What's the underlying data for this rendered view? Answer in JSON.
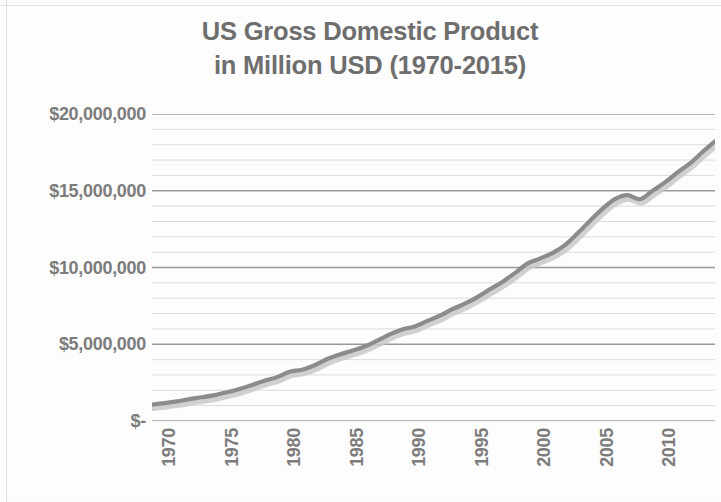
{
  "chart_data": {
    "type": "line",
    "title": "US Gross Domestic Product\nin Million USD (1970-2015)",
    "title_line1": "US Gross Domestic Product",
    "title_line2": "in Million USD (1970-2015)",
    "xlabel": "",
    "ylabel": "",
    "ylim": [
      0,
      20000000
    ],
    "xlim": [
      1970,
      2015
    ],
    "grid": true,
    "grid_major_step": 5000000,
    "grid_minor_step": 1000000,
    "legend": "none",
    "line_color": "#8c8c8c",
    "shadow_color": "#c9c9c9",
    "text_color": "#7c7c7c",
    "gridline_major_color": "#9a9a9a",
    "gridline_minor_color": "#dcdcdc",
    "y_tick_labels": [
      "$20,000,000",
      "$15,000,000",
      "$10,000,000",
      "$5,000,000",
      "$-"
    ],
    "y_tick_values": [
      20000000,
      15000000,
      10000000,
      5000000,
      0
    ],
    "x_tick_labels": [
      "1970",
      "1975",
      "1980",
      "1985",
      "1990",
      "1995",
      "2000",
      "2005",
      "2010",
      "2015"
    ],
    "x_tick_values": [
      1970,
      1975,
      1980,
      1985,
      1990,
      1995,
      2000,
      2005,
      2010,
      2015
    ],
    "x": [
      1970,
      1971,
      1972,
      1973,
      1974,
      1975,
      1976,
      1977,
      1978,
      1979,
      1980,
      1981,
      1982,
      1983,
      1984,
      1985,
      1986,
      1987,
      1988,
      1989,
      1990,
      1991,
      1992,
      1993,
      1994,
      1995,
      1996,
      1997,
      1998,
      1999,
      2000,
      2001,
      2002,
      2003,
      2004,
      2005,
      2006,
      2007,
      2008,
      2009,
      2010,
      2011,
      2012,
      2013,
      2014,
      2015
    ],
    "values": [
      1073303,
      1164850,
      1279110,
      1425376,
      1545243,
      1684904,
      1873412,
      2081826,
      2351599,
      2627334,
      2857307,
      3207042,
      3343789,
      3634038,
      4037613,
      4338979,
      4579631,
      4855215,
      5236438,
      5641599,
      5963144,
      6158129,
      6520327,
      6858559,
      7287236,
      7639749,
      8073122,
      8577554,
      9062818,
      9630664,
      10252345,
      10581821,
      10936419,
      11458243,
      12213730,
      13036640,
      13814611,
      14451860,
      14712845,
      14448933,
      14992052,
      15542582,
      16197007,
      16784851,
      17521747,
      18219297
    ]
  }
}
